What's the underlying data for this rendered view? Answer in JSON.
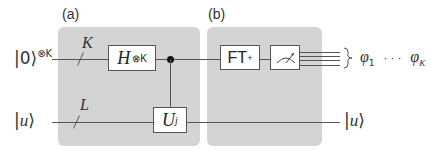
{
  "panels": {
    "a": {
      "label": "(a)"
    },
    "b": {
      "label": "(b)"
    }
  },
  "inputs": {
    "top": {
      "ket": "0",
      "superscript": "⊗K"
    },
    "bottom": {
      "ket": "u"
    }
  },
  "bus_labels": {
    "top": "K",
    "bottom": "L"
  },
  "gates": {
    "hadamard": {
      "base": "H",
      "superscript": "⊗K"
    },
    "controlled_unitary": {
      "base": "U",
      "superscript": "j"
    },
    "inverse_qft": {
      "base": "FT",
      "superscript": "+"
    },
    "measurement": {
      "icon": "meter-icon"
    }
  },
  "outputs": {
    "top": {
      "first": "φ",
      "first_sub": "1",
      "ellipsis": "· · ·",
      "last": "φ",
      "last_sub": "K"
    },
    "bottom": {
      "ket": "u"
    }
  },
  "colors": {
    "panel_bg": "#d4d4d4",
    "wire": "#555555",
    "gate_bg": "#ffffff"
  }
}
